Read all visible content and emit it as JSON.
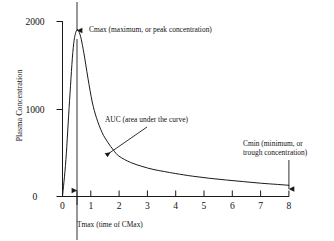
{
  "chart_data": {
    "type": "line",
    "title": "",
    "xlabel": "Tmax (time of CMax)",
    "ylabel": "Plasma Concentration",
    "xlim": [
      0,
      8
    ],
    "ylim": [
      0,
      2100
    ],
    "xticks": [
      "0",
      "1",
      "2",
      "3",
      "4",
      "5",
      "6",
      "7",
      "8"
    ],
    "xtick_values": [
      0,
      1,
      2,
      3,
      4,
      5,
      6,
      7,
      8
    ],
    "yticks": [
      "0",
      "1000",
      "2000"
    ],
    "ytick_values": [
      0,
      1000,
      2000
    ],
    "grid": false,
    "legend": "none",
    "series": [
      {
        "name": "Plasma concentration",
        "x": [
          0,
          0.12,
          0.25,
          0.38,
          0.5,
          0.62,
          0.75,
          0.9,
          1.05,
          1.2,
          1.4,
          1.6,
          1.8,
          2.0,
          2.4,
          2.8,
          3.2,
          3.6,
          4.0,
          4.6,
          5.2,
          5.8,
          6.4,
          7.0,
          7.6,
          8.0
        ],
        "values": [
          0,
          420,
          1100,
          1700,
          1900,
          1850,
          1650,
          1350,
          1080,
          900,
          730,
          620,
          530,
          460,
          390,
          345,
          310,
          285,
          262,
          232,
          208,
          188,
          170,
          152,
          138,
          128
        ]
      }
    ],
    "annotations": [
      {
        "name": "cmax",
        "text": "Cmax (maximum, or peak concentration)",
        "marker": "down-arrow-from-top",
        "points_to_x": 0.5,
        "points_to_y": 1900
      },
      {
        "name": "auc",
        "text": "AUC (area under the curve)",
        "marker": "arrow-down-left",
        "points_to_x": 1.1,
        "points_to_y": 430
      },
      {
        "name": "cmin",
        "text": "Cmin (minimum, or\ntrough concentration)",
        "marker": "down-arrow",
        "points_to_x": 8,
        "points_to_y": 128
      },
      {
        "name": "tmax",
        "text": "Tmax (time of CMax)",
        "marker": "up-arrow-vertical-line",
        "points_to_x": 0.5,
        "points_to_y": 0
      }
    ]
  },
  "colors": {
    "axis": "#1a1a1a",
    "curve": "#1a1a1a",
    "text": "#121212",
    "background": "#ffffff"
  }
}
